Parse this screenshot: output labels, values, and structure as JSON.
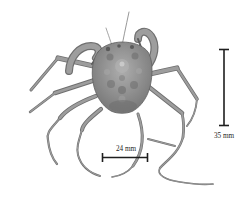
{
  "figure": {
    "type": "specimen-photograph",
    "background_color": "#ffffff",
    "specimen_colors": {
      "body": "#8e8e8e",
      "shadow": "#6f6f6f",
      "highlight": "#b2b2b2",
      "outline": "#606060"
    },
    "annotation_color": "#1e1e1e",
    "scale_bars": [
      {
        "id": "horizontal-scale",
        "label": "24 mm",
        "orientation": "horizontal",
        "position": "below-specimen"
      },
      {
        "id": "vertical-scale",
        "label": "35 mm",
        "orientation": "vertical",
        "position": "right-of-specimen"
      }
    ]
  }
}
